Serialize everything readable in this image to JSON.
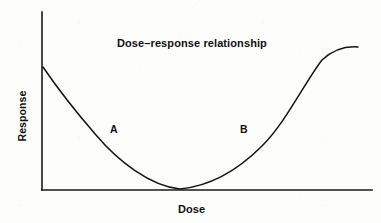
{
  "chart_data": {
    "type": "line",
    "title": "Dose–response relationship",
    "xlabel": "Dose",
    "ylabel": "Response",
    "grid": false,
    "legend": null,
    "xlim": [
      0,
      100
    ],
    "ylim": [
      0,
      100
    ],
    "axis_ticks": {
      "x": [],
      "y": []
    },
    "series": [
      {
        "name": "dose-response curve",
        "x": [
          0,
          5,
          10,
          15,
          20,
          25,
          30,
          35,
          40,
          42,
          45,
          50,
          55,
          60,
          65,
          70,
          75,
          80,
          85,
          90,
          95,
          100
        ],
        "y": [
          69,
          58,
          48,
          38,
          29,
          21,
          13,
          7,
          2,
          0,
          1,
          5,
          12,
          21,
          31,
          43,
          55,
          67,
          76,
          81,
          82,
          82
        ]
      }
    ],
    "annotations": [
      {
        "label": "A",
        "x": 21,
        "y": 34,
        "description": "descending limb of the curve"
      },
      {
        "label": "B",
        "x": 61,
        "y": 34,
        "description": "ascending limb of the curve"
      }
    ],
    "curve_path": "M 43 67 C 60 92 76 112 96 135 C 118 161 150 186 180 189 C 211 186 238 170 262 146 C 286 122 305 82 322 60 C 334 49 346 46 358 47",
    "axes": {
      "y_axis": {
        "x": 42,
        "y_top": 12,
        "y_bottom": 190
      },
      "x_axis": {
        "y": 190,
        "x_left": 42,
        "x_right": 372
      }
    },
    "colors": {
      "background": "#fdfdfc",
      "axis": "#1a1a1a",
      "curve": "#141414",
      "text": "#111111"
    }
  }
}
